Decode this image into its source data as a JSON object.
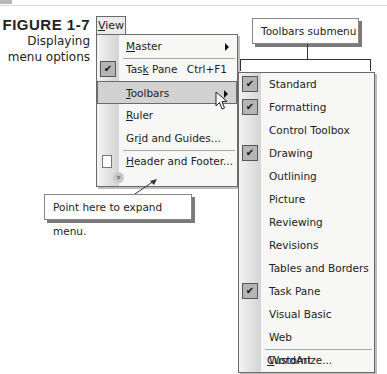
{
  "figure": {
    "number": "FIGURE 1-7",
    "caption_line1": "Displaying",
    "caption_line2": "menu options"
  },
  "menubar": {
    "view_label": "View",
    "view_mnemonic": "V"
  },
  "main_menu": {
    "items": [
      {
        "label": "Master",
        "mnemonic": "M",
        "has_submenu": true,
        "checked": false
      },
      {
        "label": "Task Pane",
        "mnemonic": "k",
        "shortcut": "Ctrl+F1",
        "checked": true
      },
      {
        "label": "Toolbars",
        "mnemonic": "T",
        "has_submenu": true,
        "highlighted": true
      },
      {
        "label": "Ruler",
        "mnemonic": "R"
      },
      {
        "label": "Grid and Guides...",
        "mnemonic": "i"
      },
      {
        "label": "Header and Footer...",
        "mnemonic": "H",
        "icon": "document-icon"
      }
    ],
    "expand_glyph": "»"
  },
  "submenu": {
    "items": [
      {
        "label": "Standard",
        "checked": true
      },
      {
        "label": "Formatting",
        "checked": true
      },
      {
        "label": "Control Toolbox",
        "checked": false
      },
      {
        "label": "Drawing",
        "checked": true
      },
      {
        "label": "Outlining",
        "checked": false
      },
      {
        "label": "Picture",
        "checked": false
      },
      {
        "label": "Reviewing",
        "checked": false
      },
      {
        "label": "Revisions",
        "checked": false
      },
      {
        "label": "Tables and Borders",
        "checked": false
      },
      {
        "label": "Task Pane",
        "checked": true
      },
      {
        "label": "Visual Basic",
        "checked": false
      },
      {
        "label": "Web",
        "checked": false
      },
      {
        "label": "WordArt",
        "checked": false
      },
      {
        "label": "Customize...",
        "mnemonic": "C"
      }
    ]
  },
  "callouts": {
    "expand": "Point here to expand menu.",
    "submenu": "Toolbars submenu"
  },
  "glyphs": {
    "check": "✔"
  },
  "colors": {
    "highlight": "#d2d2d2",
    "border": "#6a6a6a",
    "menu_bg": "#f7f7f5",
    "check_bg": "#b5b5b5"
  }
}
